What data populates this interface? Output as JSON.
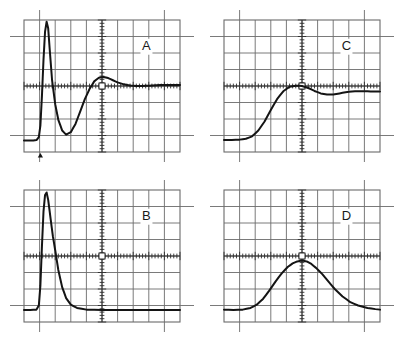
{
  "figure": {
    "title": "",
    "background_color": "#ffffff",
    "trace_color": "#141414",
    "graticule_color": "#6b6b6b",
    "panel_count": 4
  },
  "panels": [
    {
      "label": "A",
      "position": "top-left",
      "x": 8,
      "y": 8,
      "width": 188,
      "height": 158
    },
    {
      "label": "C",
      "position": "top-right",
      "x": 208,
      "y": 8,
      "width": 188,
      "height": 158
    },
    {
      "label": "B",
      "position": "bottom-left",
      "x": 8,
      "y": 178,
      "width": 188,
      "height": 158
    },
    {
      "label": "D",
      "position": "bottom-right",
      "x": 208,
      "y": 178,
      "width": 188,
      "height": 158
    }
  ],
  "graticule": {
    "divisions_x": 10,
    "divisions_y": 8,
    "center_tick_count_x": 50,
    "center_tick_count_y": 40,
    "has_center_square": true,
    "has_edge_extensions": true
  },
  "markers": {
    "panel_a_trigger_marker": "triangle-up",
    "panel_a_trigger_x_div": 1.05
  },
  "chart_data": [
    {
      "type": "line",
      "title": "A",
      "xlabel": "",
      "ylabel": "",
      "xlim": [
        0,
        10
      ],
      "ylim": [
        -4,
        4
      ],
      "grid": true,
      "legend": "none",
      "description": "Bipolar fast pulse: flat baseline, sharp positive spike to top of screen, deep undershoot, then damped ringing settling just below centerline.",
      "x": [
        0.0,
        0.3,
        0.6,
        0.8,
        0.95,
        1.05,
        1.15,
        1.25,
        1.35,
        1.45,
        1.55,
        1.65,
        1.8,
        2.0,
        2.2,
        2.45,
        2.7,
        3.0,
        3.3,
        3.6,
        3.9,
        4.2,
        4.5,
        4.8,
        5.1,
        5.4,
        5.7,
        6.0,
        6.4,
        6.8,
        7.2,
        7.6,
        8.0,
        8.5,
        9.0,
        9.5,
        10.0
      ],
      "y": [
        -3.3,
        -3.3,
        -3.3,
        -3.28,
        -3.1,
        -2.4,
        -0.6,
        1.6,
        3.3,
        3.9,
        3.5,
        2.2,
        0.35,
        -1.1,
        -2.05,
        -2.7,
        -2.95,
        -2.8,
        -2.3,
        -1.55,
        -0.8,
        -0.18,
        0.28,
        0.5,
        0.55,
        0.48,
        0.35,
        0.22,
        0.1,
        0.03,
        0.0,
        0.0,
        0.02,
        0.05,
        0.06,
        0.06,
        0.06
      ]
    },
    {
      "type": "line",
      "title": "C",
      "xlabel": "",
      "ylabel": "",
      "xlim": [
        0,
        10
      ],
      "ylim": [
        -4,
        4
      ],
      "grid": true,
      "legend": "none",
      "description": "Step-like response: flat low baseline, smooth S-shaped rise to a rounded maximum near centre, small overshoot, slight dip, then settles to a flat level.",
      "x": [
        0.0,
        0.5,
        1.0,
        1.4,
        1.8,
        2.2,
        2.6,
        3.0,
        3.4,
        3.8,
        4.2,
        4.6,
        5.0,
        5.4,
        5.8,
        6.2,
        6.6,
        7.0,
        7.4,
        7.8,
        8.2,
        8.6,
        9.0,
        9.4,
        10.0
      ],
      "y": [
        -3.28,
        -3.28,
        -3.25,
        -3.2,
        -3.05,
        -2.7,
        -2.15,
        -1.45,
        -0.8,
        -0.32,
        -0.05,
        0.02,
        0.0,
        -0.12,
        -0.3,
        -0.45,
        -0.52,
        -0.52,
        -0.45,
        -0.38,
        -0.33,
        -0.32,
        -0.32,
        -0.33,
        -0.33
      ]
    },
    {
      "type": "line",
      "title": "B",
      "xlabel": "",
      "ylabel": "",
      "xlim": [
        0,
        10
      ],
      "ylim": [
        -4,
        4
      ],
      "grid": true,
      "legend": "none",
      "description": "Narrow unipolar pulse: flat baseline, very steep rise at about 1 division, peak at top of screen, fast exponential decay back to baseline by 3 divisions, flat thereafter.",
      "x": [
        0.0,
        0.4,
        0.8,
        0.95,
        1.05,
        1.15,
        1.25,
        1.35,
        1.45,
        1.55,
        1.7,
        1.85,
        2.0,
        2.2,
        2.45,
        2.7,
        3.0,
        3.4,
        4.0,
        5.0,
        6.0,
        7.0,
        8.0,
        9.0,
        10.0
      ],
      "y": [
        -3.28,
        -3.28,
        -3.25,
        -3.0,
        -1.8,
        0.6,
        2.7,
        3.7,
        3.85,
        3.4,
        2.3,
        1.2,
        0.35,
        -0.85,
        -1.9,
        -2.55,
        -2.95,
        -3.15,
        -3.25,
        -3.28,
        -3.28,
        -3.28,
        -3.28,
        -3.28,
        -3.28
      ]
    },
    {
      "type": "line",
      "title": "D",
      "xlabel": "",
      "ylabel": "",
      "xlim": [
        0,
        10
      ],
      "ylim": [
        -4,
        4
      ],
      "grid": true,
      "legend": "none",
      "description": "Broad smooth bell-shaped pulse centred on the vertical centre line, peaking about one division below centre, with a long tail to the right.",
      "x": [
        0.0,
        0.6,
        1.2,
        1.7,
        2.1,
        2.5,
        2.9,
        3.3,
        3.7,
        4.1,
        4.4,
        4.7,
        5.0,
        5.3,
        5.6,
        5.9,
        6.3,
        6.7,
        7.1,
        7.6,
        8.1,
        8.6,
        9.2,
        9.7,
        10.0
      ],
      "y": [
        -3.25,
        -3.28,
        -3.25,
        -3.15,
        -2.95,
        -2.6,
        -2.1,
        -1.55,
        -1.05,
        -0.65,
        -0.45,
        -0.33,
        -0.28,
        -0.33,
        -0.48,
        -0.72,
        -1.1,
        -1.55,
        -2.0,
        -2.45,
        -2.8,
        -3.0,
        -3.15,
        -3.22,
        -3.25
      ]
    }
  ]
}
